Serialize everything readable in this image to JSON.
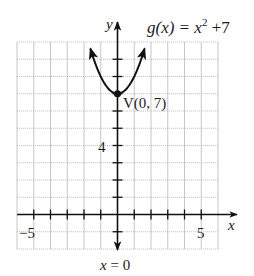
{
  "chart_data": {
    "type": "line",
    "function": {
      "name": "g",
      "expression": "x^2 + 7",
      "label_prefix": "g(x) = x",
      "label_exponent": "2",
      "label_suffix": " +7"
    },
    "xlabel": "x",
    "ylabel": "y",
    "xlim": [
      -6,
      6
    ],
    "ylim": [
      -2,
      10
    ],
    "grid": true,
    "x_ticks": [
      -5,
      -4,
      -3,
      -2,
      -1,
      1,
      2,
      3,
      4,
      5
    ],
    "y_ticks": [
      -1,
      1,
      2,
      3,
      4,
      5,
      6,
      7,
      8,
      9
    ],
    "x_tick_labels": [
      {
        "value": -5,
        "text": "−5"
      },
      {
        "value": 5,
        "text": "5"
      }
    ],
    "y_tick_labels": [
      {
        "value": 4,
        "text": "4"
      }
    ],
    "x_domain_drawn": [
      -1.62,
      1.62
    ],
    "vertex": {
      "x": 0,
      "y": 7,
      "label": "V(0, 7)"
    },
    "axis_of_symmetry": {
      "label": "x = 0",
      "x": 0
    },
    "series": [
      {
        "name": "g(x) = x^2 + 7",
        "x": [
          -1.62,
          -1.5,
          -1,
          -0.5,
          0,
          0.5,
          1,
          1.5,
          1.62
        ],
        "y": [
          9.62,
          9.25,
          8,
          7.25,
          7,
          7.25,
          8,
          9.25,
          9.62
        ]
      }
    ]
  },
  "colors": {
    "grid": "#b8b8b8",
    "axis": "#111111",
    "curve": "#111111",
    "text": "#1a1a1a"
  }
}
